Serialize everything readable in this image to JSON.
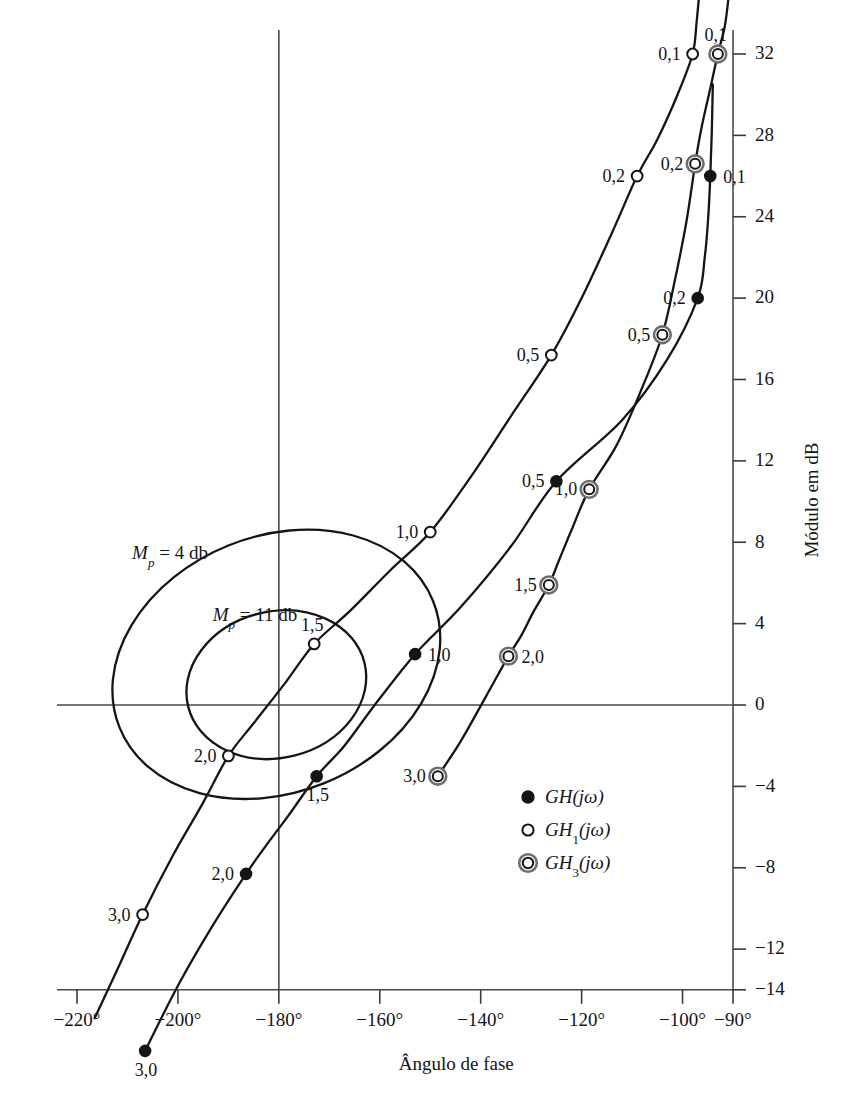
{
  "chart_data": {
    "type": "line",
    "title": "",
    "xlabel": "Ângulo de fase",
    "ylabel": "Módulo em dB",
    "xlim": [
      -232,
      -90
    ],
    "ylim": [
      -14,
      32
    ],
    "grid": false,
    "legend_position": "center-right",
    "x_ticks": [
      {
        "value": -220,
        "label": "−220°"
      },
      {
        "value": -200,
        "label": "−200°"
      },
      {
        "value": -180,
        "label": "−180°"
      },
      {
        "value": -160,
        "label": "−160°"
      },
      {
        "value": -140,
        "label": "−140°"
      },
      {
        "value": -120,
        "label": "−120°"
      },
      {
        "value": -100,
        "label": "−100°"
      },
      {
        "value": -90,
        "label": "−90°"
      }
    ],
    "y_ticks": [
      {
        "value": 32,
        "label": "32"
      },
      {
        "value": 28,
        "label": "28"
      },
      {
        "value": 24,
        "label": "24"
      },
      {
        "value": 20,
        "label": "20"
      },
      {
        "value": 16,
        "label": "16"
      },
      {
        "value": 12,
        "label": "12"
      },
      {
        "value": 8,
        "label": "8"
      },
      {
        "value": 4,
        "label": "4"
      },
      {
        "value": 0,
        "label": "0"
      },
      {
        "value": -4,
        "label": "−4"
      },
      {
        "value": -8,
        "label": "−8"
      },
      {
        "value": -12,
        "label": "−12"
      },
      {
        "value": -14,
        "label": "−14"
      }
    ],
    "series": [
      {
        "name": "GH(jω)",
        "marker": "filled-circle",
        "points": [
          {
            "x": -94.5,
            "y": 26.0,
            "label": "0,1",
            "label_pos": "right"
          },
          {
            "x": -97.0,
            "y": 20.0,
            "label": "0,2",
            "label_pos": "left"
          },
          {
            "x": -125.0,
            "y": 11.0,
            "label": "0,5",
            "label_pos": "left"
          },
          {
            "x": -153.0,
            "y": 2.5,
            "label": "1,0",
            "label_pos": "right"
          },
          {
            "x": -172.5,
            "y": -3.5,
            "label": "1,5",
            "label_pos": "below"
          },
          {
            "x": -186.5,
            "y": -8.3,
            "label": "2,0",
            "label_pos": "left"
          },
          {
            "x": -206.5,
            "y": -17.0,
            "label": "3,0",
            "label_pos": "below"
          }
        ]
      },
      {
        "name": "GH₁(jω)",
        "marker": "open-circle",
        "points": [
          {
            "x": -98.0,
            "y": 32.0,
            "label": "0,1",
            "label_pos": "left"
          },
          {
            "x": -109.0,
            "y": 26.0,
            "label": "0,2",
            "label_pos": "left"
          },
          {
            "x": -126.0,
            "y": 17.2,
            "label": "0,5",
            "label_pos": "left"
          },
          {
            "x": -150.0,
            "y": 8.5,
            "label": "1,0",
            "label_pos": "left"
          },
          {
            "x": -173.0,
            "y": 3.0,
            "label": "1,5",
            "label_pos": "above"
          },
          {
            "x": -190.0,
            "y": -2.5,
            "label": "2,0",
            "label_pos": "left"
          },
          {
            "x": -207.0,
            "y": -10.3,
            "label": "3,0",
            "label_pos": "left"
          }
        ]
      },
      {
        "name": "GH₃(jω)",
        "marker": "double-circle",
        "points": [
          {
            "x": -93.0,
            "y": 32.0,
            "label": "0,1",
            "label_pos": "above"
          },
          {
            "x": -97.5,
            "y": 26.6,
            "label": "0,2",
            "label_pos": "left"
          },
          {
            "x": -104.0,
            "y": 18.2,
            "label": "0,5",
            "label_pos": "left"
          },
          {
            "x": -118.5,
            "y": 10.6,
            "label": "1,0",
            "label_pos": "left"
          },
          {
            "x": -126.5,
            "y": 5.9,
            "label": "1,5",
            "label_pos": "left"
          },
          {
            "x": -134.5,
            "y": 2.4,
            "label": "2,0",
            "label_pos": "right"
          },
          {
            "x": -148.5,
            "y": -3.5,
            "label": "3,0",
            "label_pos": "left"
          }
        ]
      }
    ],
    "m_contours": [
      {
        "label_prefix": "M",
        "label_sub": "p",
        "label_rest": " =  4  db",
        "text": "Mp = 4 db",
        "value_db": 4,
        "center_x": -180.5,
        "center_y": 2.0,
        "rx_deg": 33.5,
        "ry_db": 6.3,
        "rotation_deg": -22
      },
      {
        "label_prefix": "M",
        "label_sub": "p",
        "label_rest": " =  11  db",
        "text": "Mp = 11 db",
        "value_db": 11,
        "center_x": -180.5,
        "center_y": 1.0,
        "rx_deg": 18.0,
        "ry_db": 3.6,
        "rotation_deg": -14
      }
    ]
  },
  "legend": {
    "entries": [
      {
        "marker": "filled-circle",
        "base": "GH",
        "sub": "",
        "arg": "(jω)",
        "text": "GH(jω)"
      },
      {
        "marker": "open-circle",
        "base": "GH",
        "sub": "1",
        "arg": "(jω)",
        "text": "GH₁(jω)"
      },
      {
        "marker": "double-circle",
        "base": "GH",
        "sub": "3",
        "arg": "(jω)",
        "text": "GH₃(jω)"
      }
    ]
  },
  "colors": {
    "curve": "#151515",
    "axis": "#4a4a4a",
    "text": "#141414",
    "background": "#ffffff"
  }
}
